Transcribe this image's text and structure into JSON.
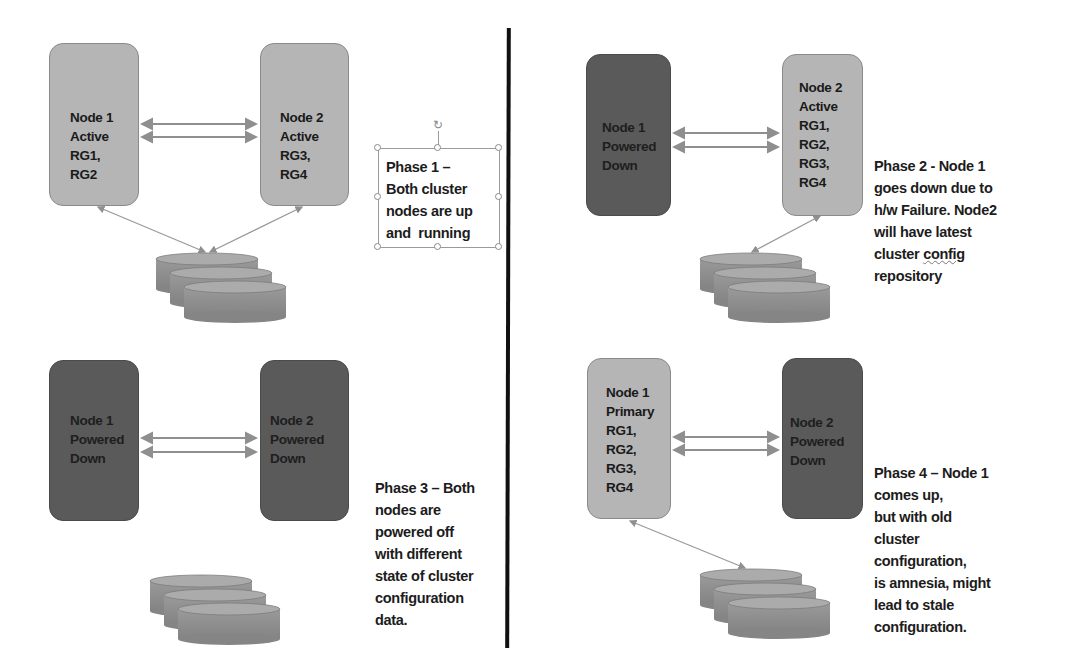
{
  "diagram": {
    "colors": {
      "active_node": "#b5b5b5",
      "powered_down_node": "#5a5a5a",
      "storage": "#8c8c8c",
      "arrow": "#8f8f8f",
      "divider": "#111111"
    },
    "phases": [
      {
        "id": "phase1",
        "node1": {
          "label": "Node 1\nActive\nRG1,\nRG2",
          "state": "active"
        },
        "node2": {
          "label": "Node 2\nActive\nRG3,\nRG4",
          "state": "active"
        },
        "storage_connected_to": [
          "node1",
          "node2"
        ],
        "description": "Phase 1 –\nBoth cluster\nnodes are up\nand  running",
        "selected": true
      },
      {
        "id": "phase2",
        "node1": {
          "label": "Node 1\nPowered\nDown",
          "state": "powered-down"
        },
        "node2": {
          "label": "Node 2\nActive\nRG1,\nRG2,\nRG3,\nRG4",
          "state": "active"
        },
        "storage_connected_to": [
          "node2"
        ],
        "description_lines": [
          "Phase 2 - Node 1",
          "goes down due to",
          "h/w Failure. Node2",
          "will have latest",
          "cluster ",
          "config",
          "repository"
        ]
      },
      {
        "id": "phase3",
        "node1": {
          "label": "Node 1\nPowered\nDown",
          "state": "powered-down"
        },
        "node2": {
          "label": "Node 2\nPowered\nDown",
          "state": "powered-down"
        },
        "storage_connected_to": [],
        "description": "Phase 3 – Both\nnodes are\npowered off\nwith different\nstate of cluster\nconfiguration\ndata."
      },
      {
        "id": "phase4",
        "node1": {
          "label": "Node 1\nPrimary\nRG1,\nRG2,\nRG3,\nRG4",
          "state": "active"
        },
        "node2": {
          "label": "Node 2\nPowered\nDown",
          "state": "powered-down"
        },
        "storage_connected_to": [
          "node1"
        ],
        "description": "Phase 4 – Node 1\ncomes up,\nbut with old\ncluster\nconfiguration,\nis amnesia, might\nlead to stale\nconfiguration."
      }
    ]
  }
}
